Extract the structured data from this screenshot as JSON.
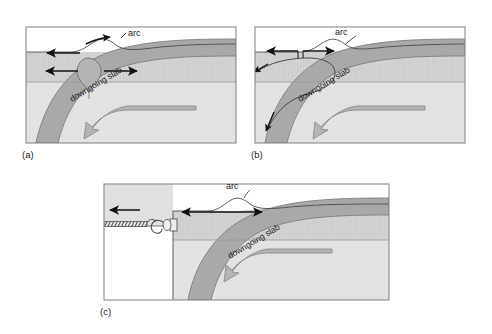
{
  "figure": {
    "type": "geological-cross-section-diagram",
    "background_color": "#ffffff",
    "panels": [
      {
        "id": "a",
        "label": "(a)",
        "caption_label": "arc",
        "slab_label": "downgoing slab",
        "mechanism": "diapir rising from slab beneath arc with divergent spreading arrows",
        "arrows": [
          "left-arrow-upper",
          "left-arrow-lower",
          "right-arrow-lower",
          "small-arc-arrow"
        ]
      },
      {
        "id": "b",
        "label": "(b)",
        "caption_label": "arc",
        "slab_label": "downgoing slab",
        "mechanism": "corner-flow / return-flow streamline hooking beneath the arc",
        "arrows": [
          "left-arrow",
          "right-arrow",
          "descending-arrow",
          "upper-left-arrow"
        ]
      },
      {
        "id": "c",
        "label": "(c)",
        "caption_label": "arc",
        "slab_label": "downgoing slab",
        "mechanism": "slab rollback: block towed to the left by rope and hook",
        "arrows": [
          "rope-pull-arrow",
          "arc-width-double-arrow"
        ]
      }
    ],
    "colors": {
      "panel_border": "#8a8a8a",
      "top_layer": "#ffffff",
      "upper_mantle": "#d2d2d2",
      "lower_mantle": "#dcdcdc",
      "slab_fill": "#a8a8a8",
      "slab_edge": "#7d7d7d",
      "flow_arrow_fill": "#b0b0b0",
      "flow_arrow_edge": "#8c8c8c",
      "line_black": "#1a1a1a",
      "crust_band": "#c8c8c8"
    }
  }
}
